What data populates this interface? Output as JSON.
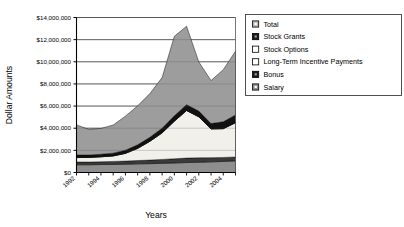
{
  "chart_data": {
    "type": "area",
    "title": "",
    "xlabel": "Years",
    "ylabel": "Dollar Amounts",
    "grid": true,
    "legend_position": "right",
    "stacked": true,
    "x": [
      1992,
      1993,
      1994,
      1995,
      1996,
      1997,
      1998,
      1999,
      2000,
      2001,
      2002,
      2003,
      2004,
      2005
    ],
    "xtick_labels": [
      "1992",
      "1994",
      "1996",
      "1998",
      "2000",
      "2002",
      "2004"
    ],
    "xtick_values": [
      1992,
      1994,
      1996,
      1998,
      2000,
      2002,
      2004
    ],
    "ylim": [
      0,
      14000000
    ],
    "ytick_values": [
      0,
      2000000,
      4000000,
      6000000,
      8000000,
      10000000,
      12000000,
      14000000
    ],
    "ytick_labels": [
      "$0",
      "$2,000,000",
      "$4,000,000",
      "$6,000,000",
      "$8,000,000",
      "$10,000,000",
      "$12,000,000",
      "$14,000,000"
    ],
    "series": [
      {
        "name": "Salary",
        "color": "#8e8e8e",
        "swatch": "gray",
        "values": [
          700000,
          700000,
          720000,
          730000,
          750000,
          780000,
          800000,
          830000,
          860000,
          900000,
          930000,
          960000,
          1000000,
          1050000
        ]
      },
      {
        "name": "Bonus",
        "color": "#3a3a3a",
        "swatch": "dark",
        "values": [
          250000,
          240000,
          250000,
          270000,
          280000,
          300000,
          320000,
          350000,
          380000,
          400000,
          400000,
          380000,
          360000,
          350000
        ]
      },
      {
        "name": "Long-Term Incentive Payments",
        "color": "#f2f0eb",
        "swatch": "white",
        "values": [
          400000,
          420000,
          450000,
          500000,
          700000,
          1100000,
          1700000,
          2400000,
          3400000,
          4300000,
          3700000,
          2600000,
          2600000,
          3100000
        ]
      },
      {
        "name": "Stock Options",
        "color": "#f2f0eb",
        "swatch": "white",
        "values": [
          0,
          0,
          0,
          0,
          0,
          0,
          0,
          0,
          0,
          0,
          0,
          0,
          0,
          0
        ]
      },
      {
        "name": "Stock Grants",
        "color": "#111111",
        "swatch": "black",
        "values": [
          230000,
          220000,
          230000,
          250000,
          280000,
          320000,
          360000,
          420000,
          480000,
          520000,
          520000,
          480000,
          620000,
          700000
        ]
      },
      {
        "name": "Total",
        "color": "#9d9d9d",
        "swatch": "lightgray",
        "values": [
          2720000,
          2320000,
          2330000,
          2540000,
          3080000,
          3520000,
          3950000,
          4570000,
          7190000,
          7090000,
          4440000,
          3890000,
          4710000,
          5760000
        ]
      }
    ],
    "legend_entries": [
      {
        "label": "Total",
        "swatch": "lightgray"
      },
      {
        "label": "Stock Grants",
        "swatch": "black"
      },
      {
        "label": "Stock Options",
        "swatch": "white"
      },
      {
        "label": "Long-Term Incentive Payments",
        "swatch": "white"
      },
      {
        "label": "Bonus",
        "swatch": "black"
      },
      {
        "label": "Salary",
        "swatch": "gray"
      }
    ]
  }
}
